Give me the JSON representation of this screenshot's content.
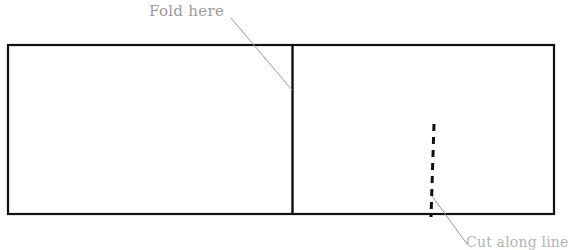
{
  "figure": {
    "type": "line-diagram",
    "background_color": "#ffffff",
    "stroke_color": "#000000",
    "annotation_color": "#9a9a9a",
    "width": 566,
    "height": 244
  },
  "annotations": {
    "fold": {
      "label": "Fold here",
      "color": "#9a9a9a",
      "leader": {
        "from_x": 231,
        "from_y": 18,
        "to_x": 292,
        "to_y": 90
      }
    },
    "cut": {
      "label": "Cut along line",
      "color": "#b4b4b4",
      "leader": {
        "from_x": 432,
        "from_y": 196,
        "to_x": 466,
        "to_y": 244
      }
    }
  },
  "shapes": {
    "outer_rectangle": {
      "name": "paper-outline",
      "x": 7,
      "y": 44,
      "width": 548,
      "height": 171,
      "stroke_width": 2
    },
    "fold_divider": {
      "name": "fold-line",
      "x": 292,
      "y_top": 44,
      "y_bottom": 215,
      "stroke_width": 2,
      "style": "solid"
    },
    "cut_dashed_line": {
      "name": "cut-line",
      "x_top": 434,
      "y_top": 124,
      "x_bottom": 431,
      "y_bottom": 217,
      "stroke_width": 3,
      "style": "dashed",
      "dash": "7 6"
    }
  }
}
